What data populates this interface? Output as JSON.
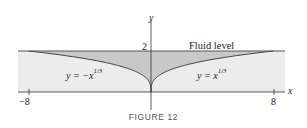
{
  "figure": {
    "caption": "FIGURE 12",
    "fluid_level_label": "Fluid level",
    "y_axis_label": "y",
    "x_axis_label": "x",
    "y_tick_label": "2",
    "x_tick_left": "−8",
    "x_tick_right": "8",
    "left_curve": {
      "lhs": "y = −x",
      "exp": "1/3"
    },
    "right_curve": {
      "lhs": "y = x",
      "exp": "1/3"
    },
    "colors": {
      "outer_fill": "#ececec",
      "inner_fill": "#c8c8c8",
      "lines": "#333333"
    }
  },
  "chart_data": {
    "type": "area",
    "title": "FIGURE 12",
    "xlabel": "x",
    "ylabel": "y",
    "xlim": [
      -8,
      8
    ],
    "ylim": [
      0,
      2
    ],
    "x_ticks": [
      -8,
      8
    ],
    "y_ticks": [
      2
    ],
    "series": [
      {
        "name": "y = -x^(1/3)",
        "domain": [
          -8,
          0
        ],
        "x": [
          -8,
          -1,
          -0.125,
          0
        ],
        "y": [
          2,
          1,
          0.5,
          0
        ]
      },
      {
        "name": "y = x^(1/3)",
        "domain": [
          0,
          8
        ],
        "x": [
          0,
          0.125,
          1,
          8
        ],
        "y": [
          0,
          0.5,
          1,
          2
        ]
      }
    ],
    "annotations": [
      "Fluid level at y = 2"
    ],
    "grid": false
  }
}
